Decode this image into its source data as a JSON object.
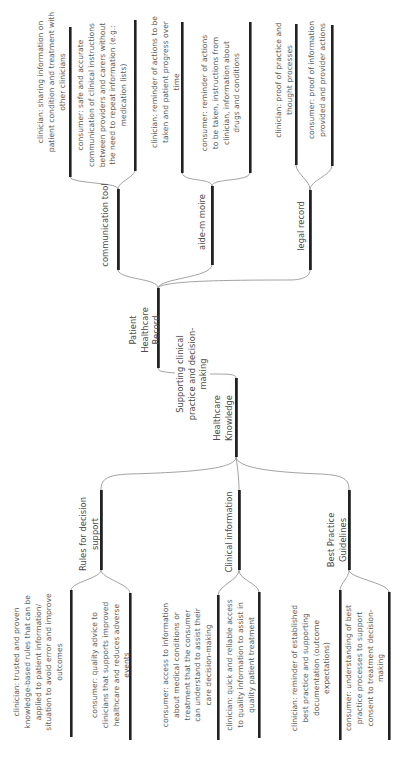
{
  "diagram": {
    "root": {
      "label": "Supporting clinical practice and decision-making",
      "children": [
        "Patient Healthcare Record",
        "Healthcare Knowledge"
      ]
    },
    "patient_healthcare_record": {
      "label": "Patient Healthcare Record",
      "branches": [
        {
          "label": "communication tool",
          "leaves": [
            "clinician: sharing information on patient condition and treatment with other clinicians",
            "consumer: safe and accurate communication of clinical instructions between providers and carers without the need to repeat information (e.g.: medication lists)"
          ]
        },
        {
          "label": "aide-m moire",
          "leaves": [
            "clinician: reminder of actions to be taken and patient progress over time",
            "consumer: reminder of actions to be taken, instructions from clinician, information about drugs and conditions"
          ]
        },
        {
          "label": "legal record",
          "leaves": [
            "clinician: proof of practice and thought processes",
            "consumer: proof of information provided and provider actions"
          ]
        }
      ]
    },
    "healthcare_knowledge": {
      "label": "Healthcare Knowledge",
      "branches": [
        {
          "label": "Rules for decision support",
          "leaves": [
            "clinician: trusted and proven knowledge-based rules that can be applied to patient information/ situation to avoid error and improve outcomes",
            "consumer: quality advice to clinicians that supports improved healthcare and reduces adverse events"
          ]
        },
        {
          "label": "Clinical information",
          "leaves": [
            "consumer: access to information about medical conditions or treatment that the consumer can understand to assist their care decision-making",
            "clinician:  quick and reliable access to quality information to assist in quality patient treatment"
          ]
        },
        {
          "label": "Best Practice Guidelines",
          "leaves": [
            "clinician: reminder of established best practice and supporting documentation (outcome expectations)",
            "consumer: understanding of best practice processes to support consent to treatment decision-making"
          ]
        }
      ]
    },
    "colors": {
      "bar": "#222222",
      "connector": "#8a8a8a",
      "text": "#555555",
      "background": "#ffffff"
    }
  }
}
